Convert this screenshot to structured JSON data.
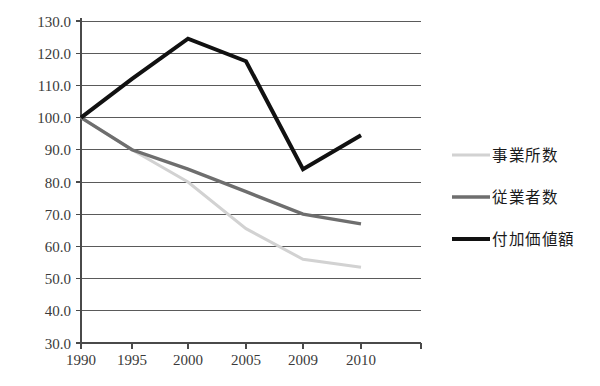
{
  "chart_data": {
    "type": "line",
    "title": "",
    "subtitle": "",
    "xlabel": "",
    "ylabel": "",
    "x": [
      "1990",
      "1995",
      "2000",
      "2005",
      "2009",
      "2010"
    ],
    "categories": [
      "1990",
      "1995",
      "2000",
      "2005",
      "2009",
      "2010"
    ],
    "series": [
      {
        "name": "事業所数",
        "color": "#d2d2d2",
        "values": [
          100.0,
          90.0,
          80.0,
          65.5,
          56.0,
          53.5
        ]
      },
      {
        "name": "従業者数",
        "color": "#6e6e6e",
        "values": [
          100.0,
          90.0,
          84.0,
          77.0,
          70.0,
          67.0
        ]
      },
      {
        "name": "付加価値額",
        "color": "#111111",
        "values": [
          100.0,
          112.0,
          124.5,
          117.5,
          84.0,
          94.5
        ]
      }
    ],
    "ylim": [
      30.0,
      130.0
    ],
    "ytick_labels": [
      "130.0",
      "120.0",
      "110.0",
      "100.0",
      "90.0",
      "80.0",
      "70.0",
      "60.0",
      "50.0",
      "40.0",
      "30.0"
    ],
    "ytick_values": [
      130.0,
      120.0,
      110.0,
      100.0,
      90.0,
      80.0,
      70.0,
      60.0,
      50.0,
      40.0,
      30.0
    ],
    "grid": true,
    "grid_axis": "y",
    "legend_position": "right",
    "legend_entries": [
      {
        "label": "事業所数",
        "color": "#d2d2d2",
        "width": 3.0
      },
      {
        "label": "従業者数",
        "color": "#6e6e6e",
        "width": 3.4
      },
      {
        "label": "付加価値額",
        "color": "#111111",
        "width": 4.0
      }
    ]
  }
}
